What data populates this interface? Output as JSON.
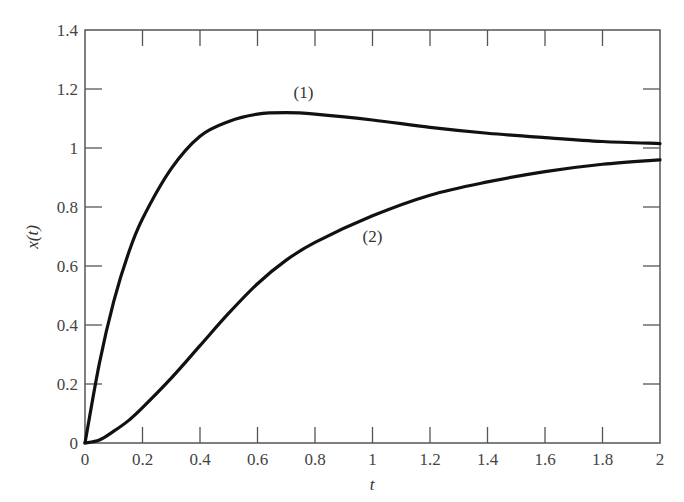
{
  "chart_data": {
    "type": "line",
    "title": "",
    "xlabel": "t",
    "ylabel": "x(t)",
    "xlim": [
      0,
      2
    ],
    "ylim": [
      0,
      1.4
    ],
    "grid": false,
    "legend": "none (curves labeled inline)",
    "x_ticks": [
      "0",
      "0.2",
      "0.4",
      "0.6",
      "0.8",
      "1",
      "1.2",
      "1.4",
      "1.6",
      "1.8",
      "2"
    ],
    "y_ticks": [
      "0",
      "0.2",
      "0.4",
      "0.6",
      "0.8",
      "1",
      "1.2",
      "1.4"
    ],
    "x": [
      0,
      0.05,
      0.1,
      0.15,
      0.2,
      0.3,
      0.4,
      0.5,
      0.6,
      0.7,
      0.8,
      1.0,
      1.2,
      1.4,
      1.6,
      1.8,
      2.0
    ],
    "series": [
      {
        "name": "(1)",
        "values": [
          0,
          0.27,
          0.48,
          0.64,
          0.76,
          0.93,
          1.04,
          1.09,
          1.115,
          1.12,
          1.115,
          1.095,
          1.07,
          1.05,
          1.035,
          1.022,
          1.015
        ]
      },
      {
        "name": "(2)",
        "values": [
          0,
          0.01,
          0.04,
          0.075,
          0.12,
          0.22,
          0.33,
          0.44,
          0.54,
          0.62,
          0.68,
          0.77,
          0.84,
          0.885,
          0.92,
          0.945,
          0.96
        ]
      }
    ],
    "annotations": [
      {
        "text": "(1)",
        "x": 0.76,
        "y": 1.17
      },
      {
        "text": "(2)",
        "x": 1.0,
        "y": 0.68
      }
    ]
  }
}
